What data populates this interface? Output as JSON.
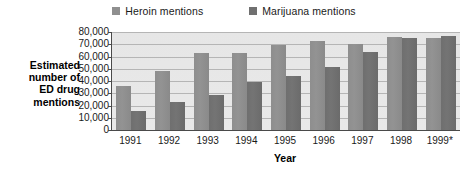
{
  "chart_data": {
    "type": "bar",
    "title": "",
    "xlabel": "Year",
    "ylabel": "Estimated number of ED drug mentions",
    "ylabel_lines": [
      "Estimated",
      "number of",
      "ED drug",
      "mentions"
    ],
    "categories": [
      "1991",
      "1992",
      "1993",
      "1994",
      "1995",
      "1996",
      "1997",
      "1998",
      "1999*"
    ],
    "series": [
      {
        "name": "Heroin mentions",
        "color": "#8f8f8f",
        "values": [
          36000,
          48000,
          62500,
          63000,
          69500,
          72500,
          70000,
          76000,
          75000
        ]
      },
      {
        "name": "Marijuana mentions",
        "color": "#707070",
        "values": [
          15500,
          23000,
          28500,
          39500,
          44000,
          51500,
          63500,
          75000,
          76500
        ]
      }
    ],
    "ylim": [
      0,
      80000
    ],
    "ytick_values": [
      0,
      10000,
      20000,
      30000,
      40000,
      50000,
      60000,
      70000,
      80000
    ],
    "ytick_labels": [
      "0",
      "10,000",
      "20,000",
      "30,000",
      "40,000",
      "50,000",
      "60,000",
      "70,000",
      "80,000"
    ],
    "grid": true,
    "legend_position": "top-center",
    "plot_background": "#e7e7e7",
    "axis_color": "#4a4a4a",
    "gridline_color": "#b5b5b5"
  }
}
